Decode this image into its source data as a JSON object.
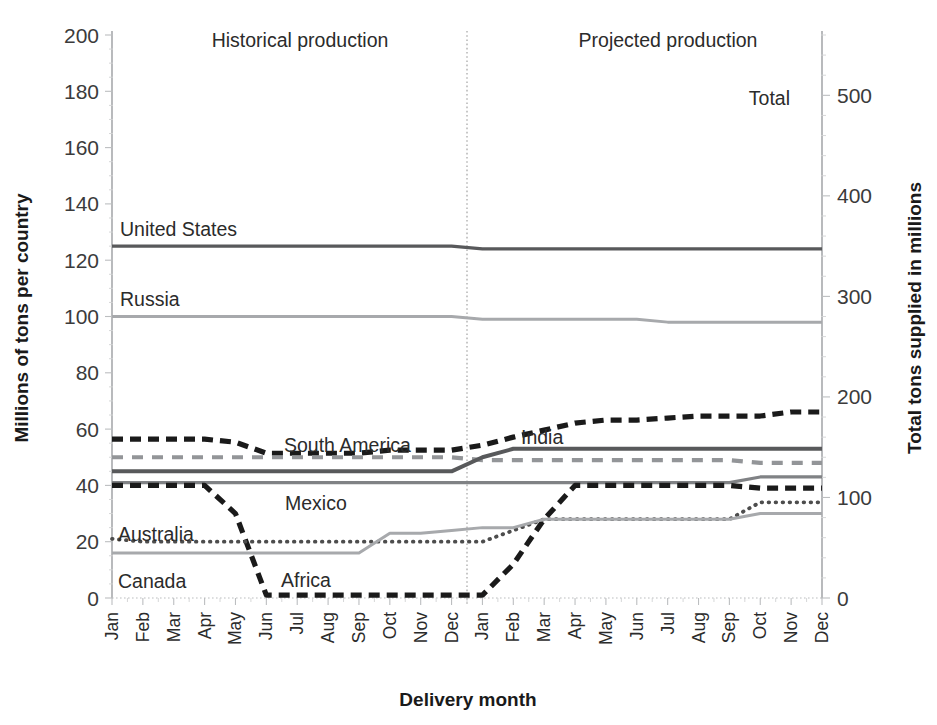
{
  "chart_data": {
    "type": "line",
    "title": "",
    "xlabel": "Delivery month",
    "ylabel": "Millions of tons per country",
    "ylabel_right": "Total tons supplied in millions",
    "ylim": [
      0,
      200
    ],
    "ylim_right": [
      0,
      560
    ],
    "ytick_labels": [
      "0",
      "20",
      "40",
      "60",
      "80",
      "100",
      "120",
      "140",
      "160",
      "180",
      "200"
    ],
    "ytick_values": [
      0,
      20,
      40,
      60,
      80,
      100,
      120,
      140,
      160,
      180,
      200
    ],
    "ytick_labels_right": [
      "0",
      "100",
      "200",
      "300",
      "400",
      "500"
    ],
    "ytick_values_right": [
      0,
      100,
      200,
      300,
      400,
      500
    ],
    "grid": false,
    "legend_position": "inline-labels",
    "categories": [
      "Jan",
      "Feb",
      "Mar",
      "Apr",
      "May",
      "Jun",
      "Jul",
      "Aug",
      "Sep",
      "Oct",
      "Nov",
      "Dec",
      "Jan",
      "Feb",
      "Mar",
      "Apr",
      "May",
      "Jun",
      "Jul",
      "Aug",
      "Sep",
      "Oct",
      "Nov",
      "Dec"
    ],
    "annotations": [
      {
        "text": "Historical production",
        "x_month": "Apr",
        "segment": "historical"
      },
      {
        "text": "Projected production",
        "x_month": "Apr",
        "segment": "projected"
      }
    ],
    "divider": {
      "after_category_index": 11,
      "style": "dotted",
      "label": "year boundary between historical and projected"
    },
    "series": [
      {
        "name": "Total",
        "axis": "right",
        "style": "dashed-heavy",
        "color": "#1a1a1a",
        "label_at_index": 21,
        "values": [
          158,
          158,
          158,
          158,
          155,
          144,
          144,
          144,
          144,
          147,
          147,
          147,
          152,
          160,
          167,
          174,
          177,
          177,
          179,
          181,
          181,
          181,
          185,
          185
        ]
      },
      {
        "name": "United States",
        "axis": "left",
        "style": "solid",
        "color": "#58595b",
        "label_at_index": 0,
        "values": [
          125,
          125,
          125,
          125,
          125,
          125,
          125,
          125,
          125,
          125,
          125,
          125,
          124,
          124,
          124,
          124,
          124,
          124,
          124,
          124,
          124,
          124,
          124,
          124
        ]
      },
      {
        "name": "Russia",
        "axis": "left",
        "style": "solid-light",
        "color": "#a7a9ac",
        "label_at_index": 0,
        "values": [
          100,
          100,
          100,
          100,
          100,
          100,
          100,
          100,
          100,
          100,
          100,
          100,
          99,
          99,
          99,
          99,
          99,
          99,
          98,
          98,
          98,
          98,
          98,
          98
        ]
      },
      {
        "name": "South America",
        "axis": "left",
        "style": "dashed-light",
        "color": "#939598",
        "label_at_index": 8,
        "values": [
          50,
          50,
          50,
          50,
          50,
          50,
          50,
          50,
          50,
          50,
          50,
          50,
          49,
          49,
          49,
          49,
          49,
          49,
          49,
          49,
          49,
          48,
          48,
          48
        ]
      },
      {
        "name": "India",
        "axis": "left",
        "style": "solid-dark",
        "color": "#58595b",
        "label_at_index": 14,
        "values": [
          45,
          45,
          45,
          45,
          45,
          45,
          45,
          45,
          45,
          45,
          45,
          45,
          50,
          53,
          53,
          53,
          53,
          53,
          53,
          53,
          53,
          53,
          53,
          53
        ]
      },
      {
        "name": "Mexico",
        "axis": "left",
        "style": "solid-mid",
        "color": "#808285",
        "label_at_index": 9,
        "values": [
          41,
          41,
          41,
          41,
          41,
          41,
          41,
          41,
          41,
          41,
          41,
          41,
          41,
          41,
          41,
          41,
          41,
          41,
          41,
          41,
          41,
          43,
          43,
          43
        ]
      },
      {
        "name": "Africa",
        "axis": "left",
        "style": "dashed-heavy",
        "color": "#1a1a1a",
        "label_at_index": 6,
        "values": [
          40,
          40,
          40,
          40,
          30,
          1,
          1,
          1,
          1,
          1,
          1,
          1,
          1,
          12,
          28,
          40,
          40,
          40,
          40,
          40,
          40,
          39,
          39,
          39
        ]
      },
      {
        "name": "Australia",
        "axis": "left",
        "style": "dotted",
        "color": "#4d4d4d",
        "label_at_index": 0,
        "values": [
          21,
          20,
          20,
          20,
          20,
          20,
          20,
          20,
          20,
          20,
          20,
          20,
          20,
          24,
          28,
          28,
          28,
          28,
          28,
          28,
          28,
          34,
          34,
          34
        ]
      },
      {
        "name": "Canada",
        "axis": "left",
        "style": "solid-light2",
        "color": "#a7a9ac",
        "label_at_index": 0,
        "values": [
          16,
          16,
          16,
          16,
          16,
          16,
          16,
          16,
          16,
          23,
          23,
          24,
          25,
          25,
          28,
          28,
          28,
          28,
          28,
          28,
          28,
          30,
          30,
          30
        ]
      }
    ],
    "series_label_text": {
      "total": "Total",
      "united_states": "United States",
      "russia": "Russia",
      "south_america": "South America",
      "india": "India",
      "mexico": "Mexico",
      "africa": "Africa",
      "australia": "Australia",
      "canada": "Canada"
    },
    "colors": {
      "black": "#1a1a1a",
      "dark_gray": "#58595b",
      "mid_gray": "#808285",
      "light_gray": "#a7a9ac",
      "axis_gray": "#bcbec0",
      "background": "#ffffff"
    }
  }
}
